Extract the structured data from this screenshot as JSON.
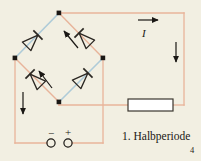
{
  "figure": {
    "background_color": "#f2efe2",
    "page_number": "4",
    "caption": "1. Halbperiode",
    "current_symbol": "I",
    "terminals": {
      "negative_sign": "−",
      "positive_sign": "+"
    },
    "colors": {
      "conducting_branch": "#aecbd8",
      "blocking_branch": "#e8b49a",
      "wire": "#e8b49a",
      "node": "#1a1714",
      "diode_outline": "#2b2722",
      "resistor_fill": "#ffffff",
      "resistor_stroke": "#3a352e",
      "arrow": "#1a1714",
      "text": "#1a1714"
    },
    "geometry": {
      "bridge_top_node": [
        59,
        13
      ],
      "bridge_left_node": [
        15,
        58
      ],
      "bridge_right_node": [
        103,
        58
      ],
      "bridge_bottom_node": [
        59,
        102
      ],
      "resistor_rect": [
        128,
        99,
        45,
        12
      ]
    },
    "elements": {
      "diode_top_left": "diode pointing toward top node (conducting)",
      "diode_top_right": "diode pointing toward top node (blocking)",
      "diode_bottom_left": "diode pointing toward left node (blocking)",
      "diode_bottom_right": "diode pointing toward right node (conducting)",
      "resistor": "load resistor",
      "ac_source_terminals": "two AC input terminals",
      "arrow_top": "current arrow pointing right",
      "arrow_right": "current arrow pointing down",
      "arrow_left": "current arrow pointing down",
      "arrow_bridge_upper": "current arrow pointing up-left inside bridge",
      "arrow_bridge_lower": "current arrow pointing up-left inside bridge"
    }
  }
}
